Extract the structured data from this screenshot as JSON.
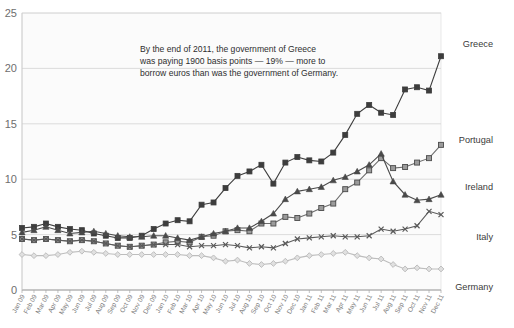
{
  "chart_data": {
    "type": "line",
    "title": "",
    "subtitle": "",
    "xlabel": "",
    "ylabel": "",
    "ylim": [
      0,
      25
    ],
    "yticks": [
      0,
      5,
      10,
      15,
      20,
      25
    ],
    "grid": true,
    "legend_position": "right-inline",
    "annotations": [
      {
        "name": "callout",
        "lines": [
          "By the end of 2011, the government of Greece",
          "was paying 1900 basis points — 19% — more to",
          "borrow euros than was the government of Germany."
        ]
      }
    ],
    "categories": [
      "Jan 09",
      "Feb 09",
      "Mar 09",
      "Apr 09",
      "May 09",
      "Jun 09",
      "Jul 09",
      "Aug 09",
      "Sep 09",
      "Oct 09",
      "Nov 09",
      "Dec 09",
      "Jan 10",
      "Feb 10",
      "Mar 10",
      "Apr 10",
      "May 10",
      "Jun 10",
      "Jul 10",
      "Aug 10",
      "Sep 10",
      "Oct 10",
      "Nov 10",
      "Dec 10",
      "Jan 11",
      "Feb 11",
      "Mar 11",
      "Apr 11",
      "May 11",
      "Jun 11",
      "Jul 11",
      "Aug 11",
      "Sep 11",
      "Oct 11",
      "Nov 11",
      "Dec 11"
    ],
    "series": [
      {
        "name": "Greece",
        "color": "#3d3d3d",
        "marker": "square-filled",
        "values": [
          5.6,
          5.7,
          6.0,
          5.7,
          5.5,
          5.4,
          5.1,
          4.9,
          4.7,
          4.7,
          4.9,
          5.5,
          6.0,
          6.3,
          6.2,
          7.7,
          7.9,
          9.2,
          10.3,
          10.7,
          11.3,
          9.6,
          11.5,
          12.0,
          11.7,
          11.6,
          12.4,
          14.0,
          15.9,
          16.7,
          16.0,
          15.8,
          18.1,
          18.3,
          18.0,
          21.1
        ]
      },
      {
        "name": "Portugal",
        "color": "#6d6d6d",
        "marker": "square-open",
        "values": [
          4.6,
          4.5,
          4.6,
          4.5,
          4.4,
          4.5,
          4.4,
          4.2,
          4.0,
          3.9,
          4.0,
          4.1,
          4.3,
          4.4,
          4.3,
          4.8,
          4.9,
          5.3,
          5.4,
          5.3,
          6.0,
          6.0,
          6.6,
          6.5,
          6.9,
          7.4,
          7.8,
          9.1,
          9.7,
          10.8,
          11.9,
          11.0,
          11.1,
          11.5,
          11.9,
          13.1
        ]
      },
      {
        "name": "Ireland",
        "color": "#4a4a4a",
        "marker": "triangle-filled",
        "values": [
          5.2,
          5.4,
          5.7,
          5.4,
          5.1,
          5.2,
          5.3,
          5.1,
          4.9,
          4.8,
          4.8,
          4.9,
          4.9,
          4.7,
          4.5,
          4.8,
          5.1,
          5.3,
          5.6,
          5.6,
          6.2,
          6.9,
          8.2,
          8.9,
          9.1,
          9.3,
          9.9,
          10.2,
          10.7,
          11.3,
          12.3,
          9.8,
          8.6,
          8.1,
          8.2,
          8.6
        ]
      },
      {
        "name": "Italy",
        "color": "#5a5a5a",
        "marker": "cross",
        "values": [
          4.6,
          4.5,
          4.6,
          4.5,
          4.4,
          4.5,
          4.4,
          4.2,
          4.0,
          3.9,
          4.0,
          4.1,
          4.1,
          4.1,
          3.9,
          4.0,
          4.0,
          4.1,
          4.0,
          3.8,
          3.9,
          3.8,
          4.2,
          4.6,
          4.7,
          4.8,
          4.9,
          4.8,
          4.8,
          4.9,
          5.5,
          5.3,
          5.5,
          5.8,
          7.1,
          6.8
        ]
      },
      {
        "name": "Germany",
        "color": "#bdbdbd",
        "marker": "diamond-open",
        "values": [
          3.2,
          3.1,
          3.1,
          3.2,
          3.4,
          3.5,
          3.4,
          3.3,
          3.2,
          3.2,
          3.2,
          3.2,
          3.2,
          3.2,
          3.1,
          3.1,
          2.9,
          2.6,
          2.7,
          2.4,
          2.3,
          2.4,
          2.6,
          2.9,
          3.1,
          3.2,
          3.3,
          3.4,
          3.1,
          2.9,
          2.8,
          2.3,
          1.9,
          2.0,
          1.9,
          1.9
        ]
      }
    ]
  }
}
